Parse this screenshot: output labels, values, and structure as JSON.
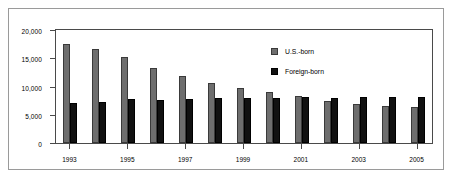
{
  "chart_data": {
    "type": "bar",
    "title": "",
    "xlabel": "",
    "ylabel": "",
    "ylim": [
      0,
      20000
    ],
    "ytick_values": [
      0,
      5000,
      10000,
      15000,
      20000
    ],
    "ytick_labels": [
      "0",
      "5,000",
      "10,000",
      "15,000",
      "20,000"
    ],
    "grid": false,
    "legend_position": "top-right-inside",
    "categories": [
      "1993",
      "1994",
      "1995",
      "1996",
      "1997",
      "1998",
      "1999",
      "2000",
      "2001",
      "2002",
      "2003",
      "2004",
      "2005"
    ],
    "xtick_labels_shown": [
      "1993",
      "1995",
      "1997",
      "1999",
      "2001",
      "2003",
      "2005"
    ],
    "series": [
      {
        "name": "U.S.-born",
        "color": "#6e6e6e",
        "values": [
          17500,
          16600,
          15200,
          13300,
          11900,
          10700,
          9800,
          9000,
          8300,
          7500,
          6900,
          6600,
          6400
        ]
      },
      {
        "name": "Foreign-born",
        "color": "#111111",
        "values": [
          7000,
          7200,
          7800,
          7600,
          7800,
          7900,
          7900,
          7900,
          8200,
          8000,
          8100,
          8200,
          8100
        ]
      }
    ]
  },
  "legend": {
    "items": [
      {
        "label": "U.S.-born",
        "swatch": "us"
      },
      {
        "label": "Foreign-born",
        "swatch": "fb"
      }
    ]
  }
}
